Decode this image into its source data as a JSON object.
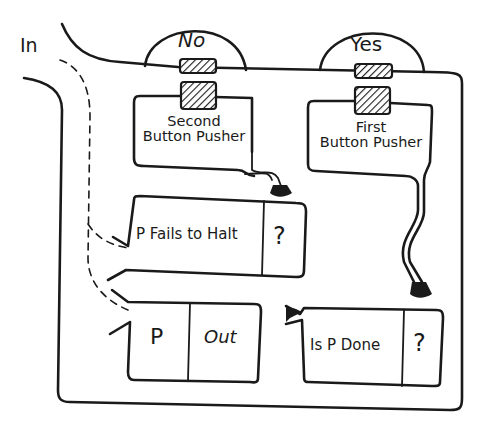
{
  "diagram": {
    "input_label": "In",
    "domes": [
      {
        "id": "no",
        "label": "No"
      },
      {
        "id": "yes",
        "label": "Yes"
      }
    ],
    "pushers": [
      {
        "id": "second",
        "line1": "Second",
        "line2": "Button Pusher"
      },
      {
        "id": "first",
        "line1": "First",
        "line2": "Button Pusher"
      }
    ],
    "boxes": {
      "fails_to_halt": {
        "label": "P Fails to Halt",
        "result": "?"
      },
      "program": {
        "label": "P",
        "output": "Out"
      },
      "is_done": {
        "label": "Is P Done",
        "result": "?"
      }
    },
    "colors": {
      "ink": "#1a1a1a",
      "background": "#ffffff"
    }
  }
}
